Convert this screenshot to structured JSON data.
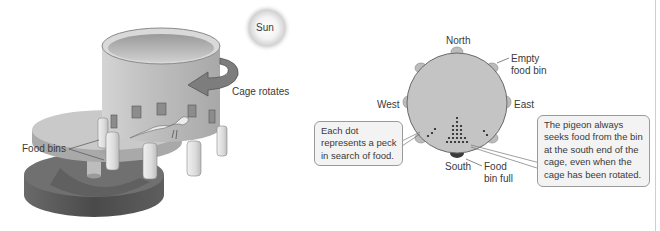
{
  "left_panel": {
    "sun_label": "Sun",
    "rotation_label": "Cage rotates",
    "food_bins_label": "Food bins"
  },
  "right_panel": {
    "compass": {
      "north": "North",
      "south": "South",
      "east": "East",
      "west": "West"
    },
    "empty_bin_label": [
      "Empty",
      "food bin"
    ],
    "full_bin_label": [
      "Food",
      "bin full"
    ],
    "dot_callout": [
      "Each dot",
      "represents a peck",
      "in search of food."
    ],
    "pigeon_callout": [
      "The pigeon always",
      "seeks food from the bin",
      "at the south end of the",
      "cage, even when the",
      "cage has been rotated."
    ]
  },
  "colors": {
    "cage": "#b9b9b9",
    "cage_dark": "#8e8e8e",
    "base": "#5a5a5a",
    "circle": "#c4c4c4",
    "full_bin": "#3a3a3a",
    "arrow": "#7d7d7d",
    "callout_bg": "#f3f3f3"
  }
}
